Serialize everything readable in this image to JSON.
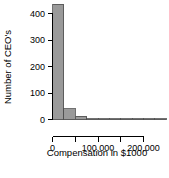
{
  "chart_data": {
    "type": "bar",
    "title": "",
    "subtitle": "",
    "xlabel": "Compensation in $1000",
    "ylabel": "Number of CEO's",
    "xlim": [
      0,
      250000
    ],
    "ylim": [
      0,
      440
    ],
    "grid": false,
    "legend": null,
    "bin_width": 25000,
    "x_tick_values": [
      0,
      50000,
      100000,
      150000,
      200000
    ],
    "x_tick_labels": [
      "0",
      "",
      "100,000",
      "",
      "200,000"
    ],
    "y_tick_values": [
      0,
      100,
      200,
      300,
      400
    ],
    "y_tick_labels": [
      "0",
      "100",
      "200",
      "300",
      "400"
    ],
    "categories": [
      "0-25,000",
      "25,000-50,000",
      "50,000-75,000",
      "75,000-100,000",
      "100,000-125,000",
      "125,000-150,000",
      "150,000-175,000",
      "175,000-200,000",
      "200,000-225,000",
      "225,000-250,000"
    ],
    "bin_starts": [
      0,
      25000,
      50000,
      75000,
      100000,
      125000,
      150000,
      175000,
      200000,
      225000
    ],
    "values": [
      435,
      40,
      12,
      3,
      1,
      0,
      0,
      0,
      0,
      1
    ],
    "bar_fill_color": "#9a9a9a",
    "bar_border_color": "#4d4d4d",
    "axis_color": "#000000",
    "background_color": "#ffffff"
  },
  "axes": {
    "x_title": "Compensation in $1000",
    "y_title": "Number of CEO's",
    "x_ticks": [
      {
        "value": 0,
        "label": "0"
      },
      {
        "value": 50000,
        "label": ""
      },
      {
        "value": 100000,
        "label": "100,000"
      },
      {
        "value": 150000,
        "label": ""
      },
      {
        "value": 200000,
        "label": "200,000"
      }
    ],
    "y_ticks": [
      {
        "value": 0,
        "label": "0"
      },
      {
        "value": 100,
        "label": "100"
      },
      {
        "value": 200,
        "label": "200"
      },
      {
        "value": 300,
        "label": "300"
      },
      {
        "value": 400,
        "label": "400"
      }
    ]
  }
}
